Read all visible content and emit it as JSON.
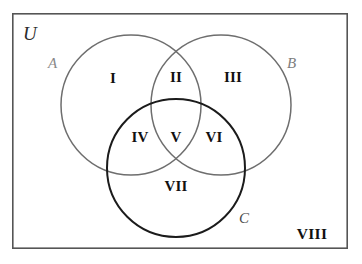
{
  "diagram": {
    "type": "venn-3-set",
    "title_visible": false,
    "universe": {
      "label": "U",
      "border_color": "#555555",
      "rect": {
        "x": 12,
        "y": 13,
        "width": 336,
        "height": 236
      }
    },
    "sets": [
      {
        "id": "A",
        "label": "A",
        "stroke": "#6e6e6e",
        "stroke_width": 1.5,
        "circle": {
          "cx": 131,
          "cy": 105,
          "r": 70
        },
        "label_pos": {
          "x": 48,
          "y": 56
        }
      },
      {
        "id": "B",
        "label": "B",
        "stroke": "#6e6e6e",
        "stroke_width": 1.5,
        "circle": {
          "cx": 221,
          "cy": 105,
          "r": 70
        },
        "label_pos": {
          "x": 287,
          "y": 56
        }
      },
      {
        "id": "C",
        "label": "C",
        "stroke": "#1b1b1b",
        "stroke_width": 2,
        "circle": {
          "cx": 176,
          "cy": 168,
          "r": 69
        },
        "label_pos": {
          "x": 239,
          "y": 211
        }
      }
    ],
    "universe_label_pos": {
      "x": 23,
      "y": 24
    },
    "regions": [
      {
        "id": "region-1",
        "label": "I",
        "meaning": "A only",
        "x": 113,
        "y": 78
      },
      {
        "id": "region-2",
        "label": "II",
        "meaning": "A and B only",
        "x": 176,
        "y": 77
      },
      {
        "id": "region-3",
        "label": "III",
        "meaning": "B only",
        "x": 233,
        "y": 77
      },
      {
        "id": "region-4",
        "label": "IV",
        "meaning": "A and C only",
        "x": 140,
        "y": 137
      },
      {
        "id": "region-5",
        "label": "V",
        "meaning": "A and B and C",
        "x": 176,
        "y": 137
      },
      {
        "id": "region-6",
        "label": "VI",
        "meaning": "B and C only",
        "x": 214,
        "y": 137
      },
      {
        "id": "region-7",
        "label": "VII",
        "meaning": "C only",
        "x": 176,
        "y": 186
      },
      {
        "id": "region-8",
        "label": "VIII",
        "meaning": "outside all sets",
        "x": 312,
        "y": 234
      }
    ],
    "colors": {
      "background": "#ffffff",
      "text": "#111111",
      "set_a_stroke": "#6e6e6e",
      "set_b_stroke": "#6e6e6e",
      "set_c_stroke": "#1b1b1b",
      "universe_border": "#555555"
    }
  }
}
